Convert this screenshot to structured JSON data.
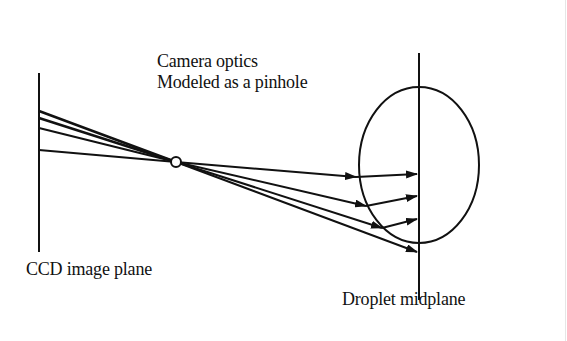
{
  "labels": {
    "optics_line1": "Camera optics",
    "optics_line2": "Modeled as a pinhole",
    "ccd": "CCD image plane",
    "midplane": "Droplet midplane"
  },
  "colors": {
    "stroke": "#111111",
    "background": "#ffffff"
  }
}
